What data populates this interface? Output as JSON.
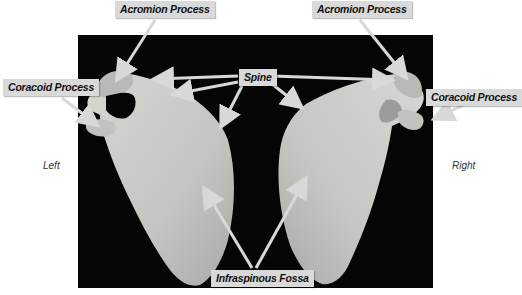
{
  "figure": {
    "background_color": "#ffffff",
    "panel_color": "#050505",
    "bone_color": "#c8c8c4",
    "label_box_color": "#d9d9d9",
    "arrow_color": "#d8d8d8"
  },
  "labels": {
    "acromion_left": "Acromion Process",
    "acromion_right": "Acromion Process",
    "coracoid_left": "Coracoid Process",
    "coracoid_right": "Coracoid Process",
    "spine": "Spine",
    "infraspinous": "Infraspinous Fossa"
  },
  "sides": {
    "left": "Left",
    "right": "Right"
  }
}
